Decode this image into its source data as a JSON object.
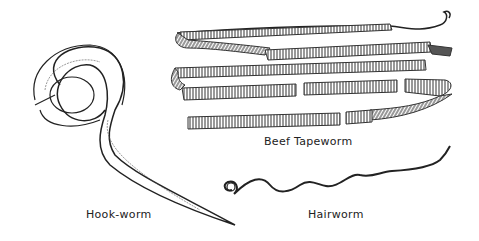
{
  "illustration": {
    "labels": {
      "hookworm": "Hook-worm",
      "tapeworm": "Beef Tapeworm",
      "hairworm": "Hairworm"
    },
    "colors": {
      "ink": "#222222",
      "background": "#ffffff"
    }
  }
}
